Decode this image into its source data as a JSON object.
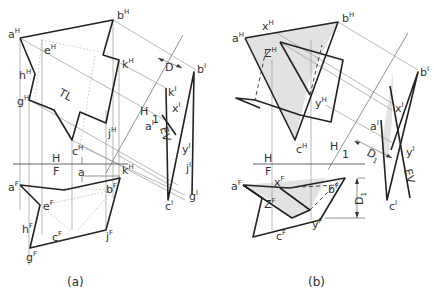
{
  "figure": {
    "panels": [
      {
        "caption": "(a)",
        "labels": {
          "aH": {
            "b": "a",
            "s": "H"
          },
          "bH": {
            "b": "b",
            "s": "H"
          },
          "eH": {
            "b": "e",
            "s": "H"
          },
          "hH": {
            "b": "h",
            "s": "H"
          },
          "gH": {
            "b": "g",
            "s": "H"
          },
          "kH": {
            "b": "k",
            "s": "H"
          },
          "cH": {
            "b": "c",
            "s": "H"
          },
          "jH": {
            "b": "j",
            "s": "H"
          },
          "kH2": {
            "b": "k",
            "s": "H"
          },
          "TL": "TL",
          "D": "D",
          "H1_H": "H",
          "H1_1": "1",
          "EV": "EV",
          "b1": {
            "b": "b",
            "s": "I"
          },
          "k1": {
            "b": "k",
            "s": "I"
          },
          "x1": {
            "b": "x",
            "s": "I"
          },
          "a1": {
            "b": "a",
            "s": "I"
          },
          "y1": {
            "b": "y",
            "s": "I"
          },
          "j1": {
            "b": "j",
            "s": "I"
          },
          "c1": {
            "b": "c",
            "s": "I"
          },
          "g1": {
            "b": "g",
            "s": "I"
          },
          "HF_H": "H",
          "HF_F": "F",
          "a_small": "a",
          "aF": {
            "b": "a",
            "s": "F"
          },
          "eF": {
            "b": "e",
            "s": "F"
          },
          "bF": {
            "b": "b",
            "s": "F"
          },
          "hF": {
            "b": "h",
            "s": "F"
          },
          "cF": {
            "b": "c",
            "s": "F"
          },
          "jF": {
            "b": "j",
            "s": "F"
          },
          "gF": {
            "b": "g",
            "s": "F"
          }
        }
      },
      {
        "caption": "(b)",
        "labels": {
          "aH": {
            "b": "a",
            "s": "H"
          },
          "xH": {
            "b": "x",
            "s": "H"
          },
          "bH": {
            "b": "b",
            "s": "H"
          },
          "zH": {
            "b": "Z",
            "s": "H"
          },
          "yH": {
            "b": "y",
            "s": "H"
          },
          "cH": {
            "b": "c",
            "s": "H"
          },
          "b1": {
            "b": "b",
            "s": "I"
          },
          "x1": {
            "b": "x",
            "s": "I"
          },
          "a1": {
            "b": "a",
            "s": "I"
          },
          "y1": {
            "b": "y",
            "s": "I"
          },
          "c1": {
            "b": "c",
            "s": "I"
          },
          "EV": "EV",
          "H1_H": "H",
          "H1_1": "1",
          "D1": "D",
          "D1s": "1",
          "HF_H": "H",
          "HF_F": "F",
          "D1v": "D",
          "D1vs": "1",
          "aF": {
            "b": "a",
            "s": "F"
          },
          "xF": {
            "b": "x",
            "s": "F"
          },
          "bF": {
            "b": "b",
            "s": "F"
          },
          "zF": {
            "b": "Z",
            "s": "F"
          },
          "yF": {
            "b": "y",
            "s": "F"
          },
          "cF": {
            "b": "c",
            "s": "F"
          }
        }
      }
    ]
  }
}
